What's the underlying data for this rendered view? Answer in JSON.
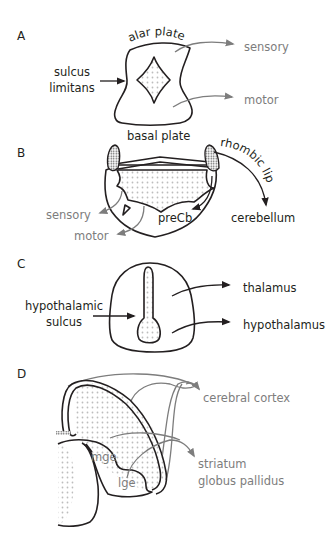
{
  "colors": {
    "ink": "#231f20",
    "gray_label": "#7d7d7d",
    "stipple": "#bdbdbd"
  },
  "panels": {
    "A": {
      "letter": "A",
      "labels": {
        "top": "alar plate",
        "bottom": "basal plate",
        "left_line1": "sulcus",
        "left_line2": "limitans",
        "sensory": "sensory",
        "motor": "motor"
      }
    },
    "B": {
      "letter": "B",
      "labels": {
        "rhombic_lip": "rhombic lip",
        "cerebellum": "cerebellum",
        "precb": "preCb",
        "sensory": "sensory",
        "motor": "motor"
      }
    },
    "C": {
      "letter": "C",
      "labels": {
        "left_line1": "hypothalamic",
        "left_line2": "sulcus",
        "thalamus": "thalamus",
        "hypothalamus": "hypothalamus"
      }
    },
    "D": {
      "letter": "D",
      "labels": {
        "cerebral_cortex": "cerebral cortex",
        "striatum": "striatum",
        "globus_pallidus": "globus pallidus",
        "mge": "mge",
        "lge": "lge"
      }
    }
  }
}
